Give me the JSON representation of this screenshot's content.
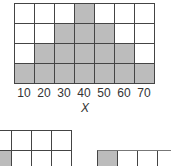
{
  "chart_data": {
    "type": "bar",
    "title": "",
    "xlabel": "X",
    "ylabel": "",
    "categories": [
      "10",
      "20",
      "30",
      "40",
      "50",
      "60",
      "70"
    ],
    "values": [
      1,
      2,
      3,
      4,
      3,
      2,
      1
    ],
    "ylim": [
      0,
      4
    ],
    "grid": true,
    "style": "shaded-grid histogram",
    "colors": {
      "filled": "#bcbcbc",
      "empty": "#ffffff",
      "line": "#444444"
    }
  },
  "axis": {
    "ticks": [
      "10",
      "20",
      "30",
      "40",
      "50",
      "60",
      "70"
    ],
    "label": "X"
  },
  "partial_grids": [
    {
      "name": "lower-left",
      "rows": 2,
      "cols": 4,
      "filled": [
        [
          1,
          0
        ]
      ]
    },
    {
      "name": "lower-right",
      "rows": 1,
      "cols": 4,
      "filled": [
        [
          0,
          0
        ]
      ]
    }
  ]
}
